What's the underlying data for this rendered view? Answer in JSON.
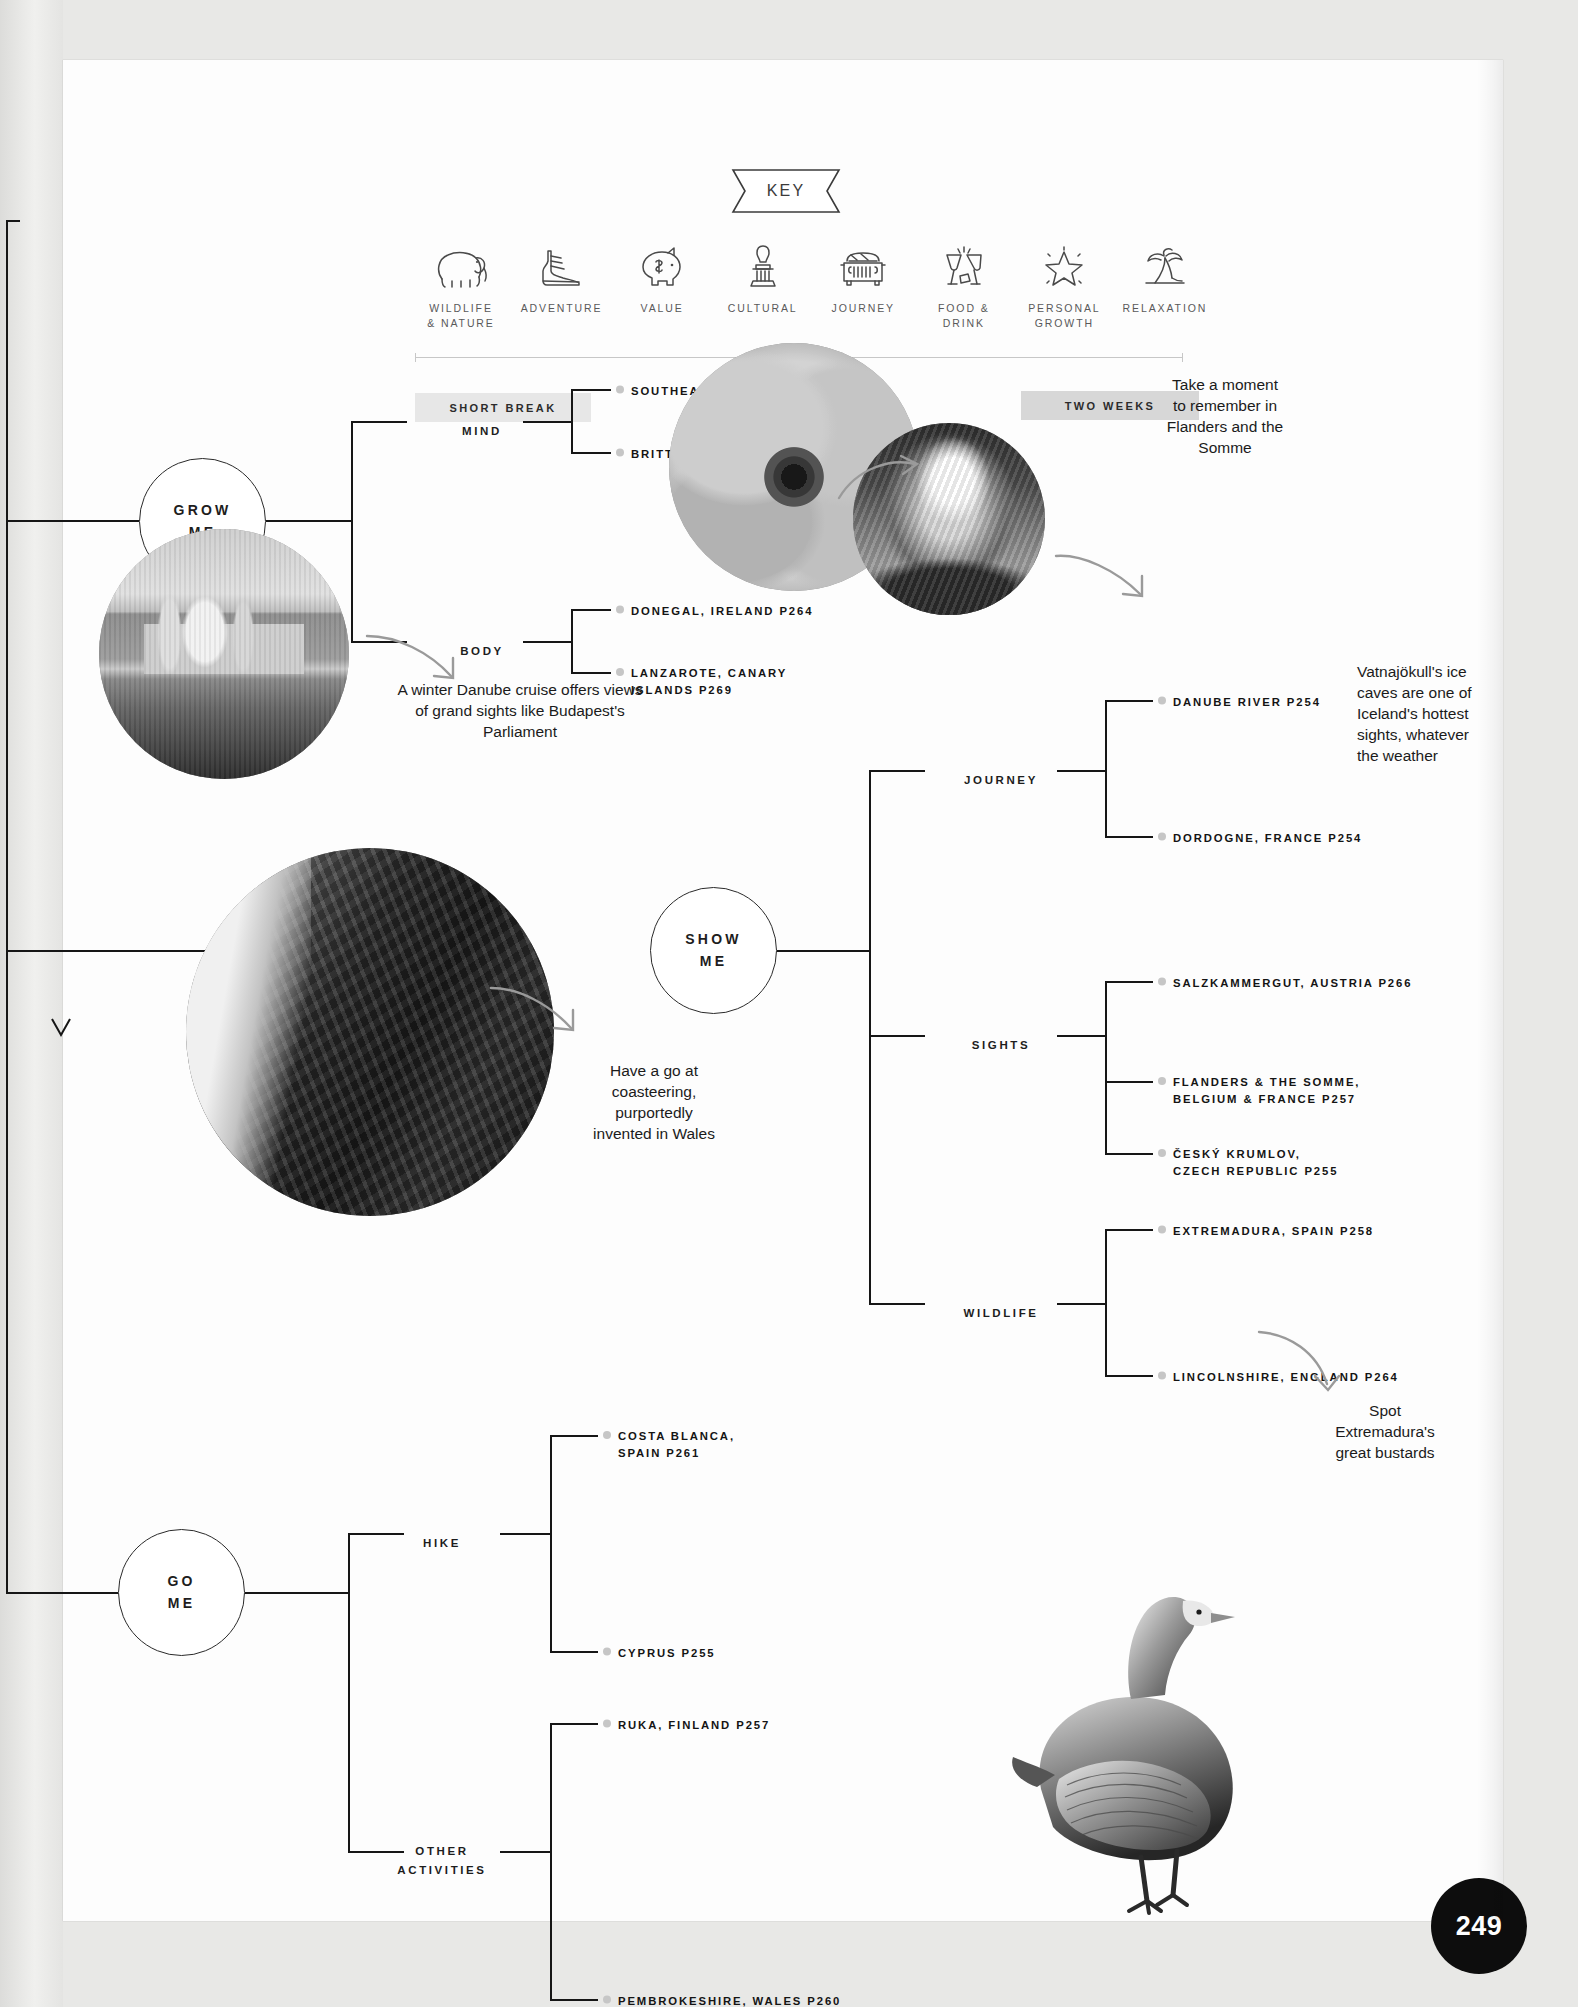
{
  "key": {
    "title": "KEY",
    "items": [
      {
        "label": "WILDLIFE\n& NATURE",
        "icon": "elephant-icon"
      },
      {
        "label": "ADVENTURE",
        "icon": "hiking-boot-icon"
      },
      {
        "label": "VALUE",
        "icon": "piggy-bank-icon"
      },
      {
        "label": "CULTURAL",
        "icon": "monument-icon"
      },
      {
        "label": "JOURNEY",
        "icon": "jeep-icon"
      },
      {
        "label": "FOOD &\nDRINK",
        "icon": "cheers-glasses-icon"
      },
      {
        "label": "PERSONAL\nGROWTH",
        "icon": "star-icon"
      },
      {
        "label": "RELAXATION",
        "icon": "palm-tree-icon"
      }
    ]
  },
  "durations": [
    {
      "label": "SHORT BREAK"
    },
    {
      "label": "ONE WEEK"
    },
    {
      "label": "TWO WEEKS"
    }
  ],
  "hubs": [
    {
      "id": "grow-me",
      "label": "GROW\nME"
    },
    {
      "id": "show-me",
      "label": "SHOW\nME"
    },
    {
      "id": "go-me",
      "label": "GO\nME"
    }
  ],
  "branches": [
    {
      "id": "mind",
      "label": "MIND"
    },
    {
      "id": "body",
      "label": "BODY"
    },
    {
      "id": "journey",
      "label": "JOURNEY"
    },
    {
      "id": "sights",
      "label": "SIGHTS"
    },
    {
      "id": "wildlife",
      "label": "WILDLIFE"
    },
    {
      "id": "hike",
      "label": "HIKE"
    },
    {
      "id": "other-activities",
      "label": "OTHER\nACTIVITIES"
    }
  ],
  "destinations": {
    "mind": [
      {
        "text": "SOUTHEAST ICELAND P252"
      },
      {
        "text": "BRITTANY, FRANCE P268"
      }
    ],
    "body": [
      {
        "text": "DONEGAL, IRELAND P264"
      },
      {
        "text": "LANZAROTE, CANARY\nISLANDS P269"
      }
    ],
    "journey": [
      {
        "text": "DANUBE RIVER P254"
      },
      {
        "text": "DORDOGNE, FRANCE P254"
      }
    ],
    "sights": [
      {
        "text": "SALZKAMMERGUT, AUSTRIA P266"
      },
      {
        "text": "FLANDERS & THE SOMME,\nBELGIUM & FRANCE P257"
      },
      {
        "text": "ČESKÝ KRUMLOV,\nCZECH REPUBLIC P255"
      }
    ],
    "wildlife": [
      {
        "text": "EXTREMADURA, SPAIN P258"
      },
      {
        "text": "LINCOLNSHIRE, ENGLAND P264"
      }
    ],
    "hike": [
      {
        "text": "COSTA BLANCA,\nSPAIN P261"
      },
      {
        "text": "CYPRUS P255"
      }
    ],
    "other_activities": [
      {
        "text": "RUKA, FINLAND P257"
      },
      {
        "text": "PEMBROKESHIRE, WALES P260"
      }
    ]
  },
  "captions": {
    "poppy": "Take a moment\nto remember in\nFlanders and the\nSomme",
    "icecave": "Vatnajökull's ice\ncaves are one of\nIceland's hottest\nsights, whatever\nthe weather",
    "budapest": "A winter Danube cruise offers views\nof grand sights like Budapest's\nParliament",
    "coasteering": "Have a go at\ncoasteering,\npurportedly\ninvented in Wales",
    "bustard": "Spot\nExtremadura's\ngreat bustards"
  },
  "page_number": "249",
  "colors": {
    "ink": "#141414",
    "line": "#161616",
    "dot": "#c6c6c6",
    "pill_1": "#e7e7e7",
    "pill_2": "#e0e0e0",
    "pill_3": "#d7d7d7",
    "paper": "#fdfdfd",
    "page_badge": "#0d0d0d"
  }
}
